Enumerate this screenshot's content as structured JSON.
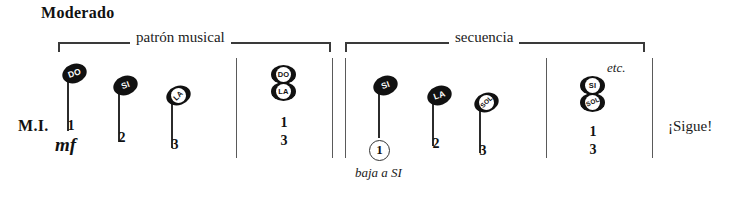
{
  "score": {
    "tempo": "Moderado",
    "hand_label": "M.I.",
    "dynamic": "mf",
    "continue_label": "¡Sigue!",
    "etc_label": "etc.",
    "cue_label": "baja a SI",
    "brackets": [
      {
        "label": "patrón musical"
      },
      {
        "label": "secuencia"
      }
    ],
    "measures": [
      {
        "name": "measure-1",
        "notes": [
          {
            "head": "DO",
            "style": "solid",
            "finger": "1"
          },
          {
            "head": "SI",
            "style": "solid",
            "finger": "2"
          },
          {
            "head": "LA",
            "style": "inner",
            "finger": "3"
          }
        ]
      },
      {
        "name": "measure-2",
        "chord": {
          "heads": [
            "DO",
            "LA"
          ],
          "fingers": [
            "1",
            "3"
          ]
        }
      },
      {
        "name": "measure-3",
        "notes": [
          {
            "head": "SI",
            "style": "solid",
            "finger": "1",
            "circled": true
          },
          {
            "head": "LA",
            "style": "solid",
            "finger": "2"
          },
          {
            "head": "SOL",
            "style": "inner",
            "finger": "3"
          }
        ]
      },
      {
        "name": "measure-4",
        "chord": {
          "heads": [
            "SI",
            "SOL"
          ],
          "fingers": [
            "1",
            "3"
          ]
        }
      }
    ],
    "colors": {
      "ink": "#111111",
      "rule": "#5a5a5a",
      "paper": "#ffffff"
    }
  }
}
